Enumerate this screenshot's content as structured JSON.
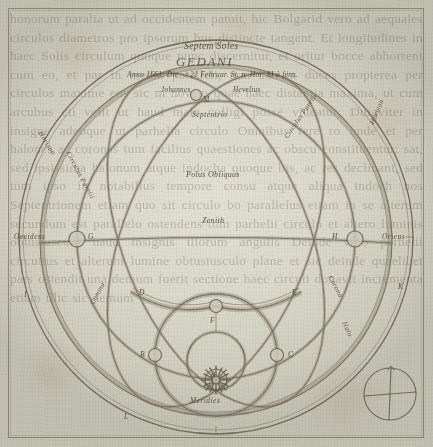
{
  "plate": {
    "title_line1": "Septem Soles",
    "title_line2": "GEDANI",
    "date_line": "Anno 1661. Die ☽ 21 Februar. St. n. Hor. XI à ſera.",
    "author_first": "Johannes",
    "author_last": "Hevelius"
  },
  "directions": {
    "north": "Septentrio",
    "south": "Meridies",
    "east": "Oriens",
    "west": "Occidens"
  },
  "center_labels": {
    "pole": "Polus Obliquus",
    "zenith": "Zenith"
  },
  "arc_labels": {
    "horizon_left": "Horizon",
    "circulus_parelii_left": "Circulus Parelii",
    "circulus_parelii_right": "Circulus Parelii",
    "horizon_right": "Horizon",
    "corona_left": "Corona",
    "corona_right": "Corona",
    "halo_lower_left": "Halo",
    "halo_lower_right": "Halo"
  },
  "keys": {
    "sun_true": "A",
    "node_west": "B",
    "node_east": "C",
    "node_upper_left": "D",
    "node_upper_right": "E",
    "node_zenith": "F",
    "node_arc_left": "G",
    "node_arc_right": "H",
    "node_outer_left": "I",
    "node_outer_right": "K",
    "node_lower": "L",
    "node_top": "M"
  },
  "compass": {
    "name": "compass-rose"
  },
  "verso_text": "honorum paralia ut ad occidentem patuit, hic Bolgarid vero ad aequales circulos diametros pro ipsorum bus distincte tangent. Et longitudines in haec Solis circulum quoque nunc discernitur, et oritur bocce abhorrent cum eo, et par in medio paralleli, non bus in duces propterea per circulos maxime eos sic m novem quae haec distantia maxima, ut cum arcubus cti velit ut haud male colligi posse videatur; Duraviter in insigne adeoque ut parhelia circulo Omnibus fere ro unde et per halones ac coronas tum facilius quaestiones ac obscu constituentur: sat, sed ipsissima halonum atque indocha quoque bis, ac res declinant, sed tum ipso in notabilius tempore consu atque aliqua indoch nos Septentrionem etiam quo sit circulo bo parallelus etiam in se alterum secundum est parallelo ostendens tum parhelii circulo et altero luminis obtusiusculo haud insignis illorum angulis Deinde vero parhelii circuitus et alterum lumine obtusiusculo plane et sic deinde quaelibet pars ostendit una demum fuerit sectione haec circuli donavit incrementa etiam illic sic demum"
}
